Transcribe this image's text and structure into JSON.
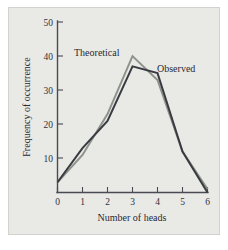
{
  "chart_data": {
    "type": "line",
    "title": "",
    "xlabel": "Number of heads",
    "ylabel": "Frequency of occurrence",
    "x": [
      0,
      1,
      2,
      3,
      4,
      5,
      6
    ],
    "xlim": [
      0,
      6
    ],
    "ylim": [
      0,
      50
    ],
    "xticks": [
      "0",
      "1",
      "2",
      "3",
      "4",
      "5",
      "6"
    ],
    "yticks": [
      "10",
      "20",
      "30",
      "40",
      "50"
    ],
    "grid": false,
    "legend_position": "inline-annotations",
    "series": [
      {
        "name": "Theoretical",
        "color": "#8e948c",
        "values": [
          3,
          11,
          23,
          40,
          33,
          12,
          1
        ]
      },
      {
        "name": "Observed",
        "color": "#3a3a42",
        "values": [
          3,
          13,
          21,
          37,
          35,
          12,
          0
        ]
      }
    ],
    "annotations": [
      {
        "text": "Theoretical",
        "x": 1.1,
        "y": 44
      },
      {
        "text": "Observed",
        "x": 4.0,
        "y": 38
      }
    ]
  },
  "axes": {
    "x_title": "Number of heads",
    "y_title": "Frequency of occurrence",
    "x_tick_labels": [
      "0",
      "1",
      "2",
      "3",
      "4",
      "5",
      "6"
    ],
    "y_tick_labels": [
      "10",
      "20",
      "30",
      "40",
      "50"
    ]
  },
  "labels": {
    "theoretical": "Theoretical",
    "observed": "Observed"
  },
  "colors": {
    "background": "#e9e9e6",
    "page": "#ffffff",
    "axis": "#4a4a52",
    "theoretical": "#8e948c",
    "observed": "#3a3a42",
    "text": "#2a2a32"
  }
}
